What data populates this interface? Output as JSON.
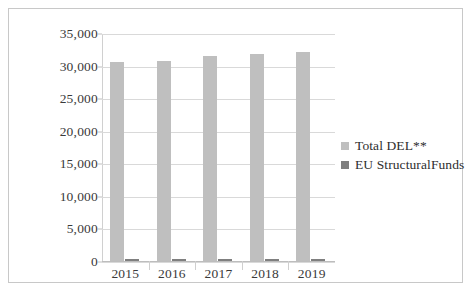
{
  "chart_data": {
    "type": "bar",
    "title": "",
    "xlabel": "",
    "ylabel": "",
    "categories": [
      "2015",
      "2016",
      "2017",
      "2018",
      "2019"
    ],
    "series": [
      {
        "name": "Total DEL**",
        "color": "#bfbfbf",
        "values": [
          30500,
          30750,
          31450,
          31750,
          32150
        ]
      },
      {
        "name": "EU StructuralFunds",
        "color": "#7f7f7f",
        "values": [
          250,
          250,
          320,
          260,
          280
        ]
      }
    ],
    "ylim": [
      0,
      35000
    ],
    "ytick_values": [
      0,
      5000,
      10000,
      15000,
      20000,
      25000,
      30000,
      35000
    ],
    "ytick_labels": [
      "0",
      "5,000",
      "10,000",
      "15,000",
      "20,000",
      "25,000",
      "30,000",
      "35,000"
    ],
    "grid": true,
    "legend_position": "right"
  }
}
